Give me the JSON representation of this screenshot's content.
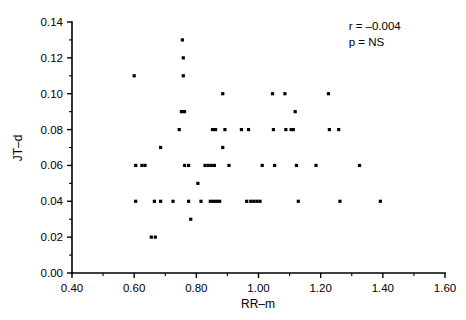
{
  "chart_data": {
    "type": "scatter",
    "title": "",
    "xlabel": "RR–m",
    "ylabel": "JT–d",
    "xlim": [
      0.4,
      1.6
    ],
    "ylim": [
      0.0,
      0.14
    ],
    "xticks": [
      "0.40",
      "0.60",
      "0.80",
      "1.00",
      "1.20",
      "1.40",
      "1.60"
    ],
    "xtick_values": [
      0.4,
      0.6,
      0.8,
      1.0,
      1.2,
      1.4,
      1.6
    ],
    "yticks": [
      "0.00",
      "0.02",
      "0.04",
      "0.06",
      "0.08",
      "0.10",
      "0.12",
      "0.14"
    ],
    "ytick_values": [
      0.0,
      0.02,
      0.04,
      0.06,
      0.08,
      0.1,
      0.12,
      0.14
    ],
    "x_minor_step": 0.1,
    "y_minor_step": 0.01,
    "grid": false,
    "legend": null,
    "marker": "square",
    "marker_color": "#000000",
    "marker_size_px": 3.2,
    "annotations": [
      {
        "name": "correlation-coefficient",
        "text": "r = –0.004",
        "x": 1.29,
        "y": 0.1355
      },
      {
        "name": "p-value",
        "text": "p = NS",
        "x": 1.29,
        "y": 0.1265
      }
    ],
    "points": [
      {
        "x": 0.6,
        "y": 0.11
      },
      {
        "x": 0.605,
        "y": 0.06
      },
      {
        "x": 0.625,
        "y": 0.06
      },
      {
        "x": 0.635,
        "y": 0.06
      },
      {
        "x": 0.605,
        "y": 0.04
      },
      {
        "x": 0.655,
        "y": 0.02
      },
      {
        "x": 0.668,
        "y": 0.02
      },
      {
        "x": 0.665,
        "y": 0.04
      },
      {
        "x": 0.685,
        "y": 0.04
      },
      {
        "x": 0.685,
        "y": 0.07
      },
      {
        "x": 0.725,
        "y": 0.04
      },
      {
        "x": 0.745,
        "y": 0.08
      },
      {
        "x": 0.755,
        "y": 0.13
      },
      {
        "x": 0.758,
        "y": 0.12
      },
      {
        "x": 0.758,
        "y": 0.11
      },
      {
        "x": 0.752,
        "y": 0.09
      },
      {
        "x": 0.762,
        "y": 0.09
      },
      {
        "x": 0.762,
        "y": 0.06
      },
      {
        "x": 0.775,
        "y": 0.06
      },
      {
        "x": 0.775,
        "y": 0.04
      },
      {
        "x": 0.782,
        "y": 0.03
      },
      {
        "x": 0.805,
        "y": 0.05
      },
      {
        "x": 0.815,
        "y": 0.04
      },
      {
        "x": 0.828,
        "y": 0.06
      },
      {
        "x": 0.838,
        "y": 0.06
      },
      {
        "x": 0.848,
        "y": 0.06
      },
      {
        "x": 0.858,
        "y": 0.06
      },
      {
        "x": 0.845,
        "y": 0.04
      },
      {
        "x": 0.855,
        "y": 0.04
      },
      {
        "x": 0.865,
        "y": 0.04
      },
      {
        "x": 0.875,
        "y": 0.04
      },
      {
        "x": 0.852,
        "y": 0.08
      },
      {
        "x": 0.862,
        "y": 0.08
      },
      {
        "x": 0.885,
        "y": 0.1
      },
      {
        "x": 0.885,
        "y": 0.07
      },
      {
        "x": 0.892,
        "y": 0.08
      },
      {
        "x": 0.905,
        "y": 0.06
      },
      {
        "x": 0.945,
        "y": 0.08
      },
      {
        "x": 0.968,
        "y": 0.08
      },
      {
        "x": 0.962,
        "y": 0.04
      },
      {
        "x": 0.975,
        "y": 0.04
      },
      {
        "x": 0.985,
        "y": 0.04
      },
      {
        "x": 0.995,
        "y": 0.04
      },
      {
        "x": 1.005,
        "y": 0.04
      },
      {
        "x": 1.012,
        "y": 0.06
      },
      {
        "x": 1.045,
        "y": 0.1
      },
      {
        "x": 1.048,
        "y": 0.08
      },
      {
        "x": 1.052,
        "y": 0.06
      },
      {
        "x": 1.085,
        "y": 0.1
      },
      {
        "x": 1.088,
        "y": 0.08
      },
      {
        "x": 1.105,
        "y": 0.08
      },
      {
        "x": 1.112,
        "y": 0.08
      },
      {
        "x": 1.118,
        "y": 0.09
      },
      {
        "x": 1.122,
        "y": 0.06
      },
      {
        "x": 1.128,
        "y": 0.04
      },
      {
        "x": 1.185,
        "y": 0.06
      },
      {
        "x": 1.225,
        "y": 0.1
      },
      {
        "x": 1.228,
        "y": 0.08
      },
      {
        "x": 1.258,
        "y": 0.08
      },
      {
        "x": 1.262,
        "y": 0.04
      },
      {
        "x": 1.325,
        "y": 0.06
      },
      {
        "x": 1.392,
        "y": 0.04
      }
    ]
  },
  "axes": {
    "x_axis_name": "x-axis",
    "y_axis_name": "y-axis"
  }
}
